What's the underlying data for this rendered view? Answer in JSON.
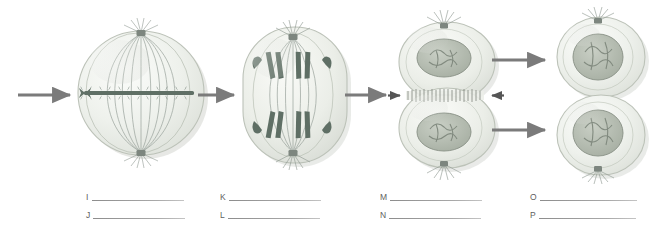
{
  "diagram": {
    "background_color": "#ffffff",
    "arrow_color": "#7a7a7a",
    "cell_membrane_color": "#d8dcd6",
    "cell_fill_color": "#e9ece6",
    "chromosome_color": "#5d6d63",
    "spindle_color": "#8d9a90",
    "nucleus_color": "#b6bdb2",
    "stages": [
      {
        "id": "stage-1",
        "name": "metaphase-cell",
        "description": "Round cell with chromosomes aligned along the equator and spindle fibers radiating from two centrosomes",
        "centrosomes": 2,
        "chromosome_count": 6
      },
      {
        "id": "stage-2",
        "name": "anaphase-cell",
        "description": "Oval elongated cell with sister chromatids pulled toward opposite poles",
        "centrosomes": 2,
        "chromosome_count": 12
      },
      {
        "id": "stage-3",
        "name": "telophase-cytokinesis-cell",
        "description": "Dumbbell shaped cell with two re-formed nuclei and a cleavage furrow pinching the middle",
        "centrosomes": 2,
        "nuclei": 2
      },
      {
        "id": "stage-4",
        "name": "daughter-cells",
        "description": "Two separated daughter cells each containing a single nucleus",
        "nuclei": 2
      }
    ],
    "arrows": [
      {
        "name": "arrow-into-stage-1",
        "direction": "right"
      },
      {
        "name": "arrow-stage-1-to-stage-2",
        "direction": "right"
      },
      {
        "name": "arrow-stage-2-to-stage-3",
        "direction": "right"
      },
      {
        "name": "arrow-stage-3-to-daughter-top",
        "direction": "right"
      },
      {
        "name": "arrow-stage-3-to-daughter-bottom",
        "direction": "right"
      },
      {
        "name": "furrow-arrow-left",
        "direction": "right"
      },
      {
        "name": "furrow-arrow-right",
        "direction": "left"
      }
    ]
  },
  "answers": {
    "line_color": "#9a9a9a",
    "columns": [
      {
        "name": "column-1",
        "rows": [
          {
            "letter": "I",
            "value": "",
            "line_width": 92
          },
          {
            "letter": "J",
            "value": "",
            "line_width": 92
          }
        ]
      },
      {
        "name": "column-2",
        "rows": [
          {
            "letter": "K",
            "value": "",
            "line_width": 92
          },
          {
            "letter": "L",
            "value": "",
            "line_width": 92
          }
        ]
      },
      {
        "name": "column-3",
        "rows": [
          {
            "letter": "M",
            "value": "",
            "line_width": 92
          },
          {
            "letter": "N",
            "value": "",
            "line_width": 92
          }
        ]
      },
      {
        "name": "column-4",
        "rows": [
          {
            "letter": "O",
            "value": "",
            "line_width": 97
          },
          {
            "letter": "P",
            "value": "",
            "line_width": 97
          }
        ]
      }
    ]
  }
}
